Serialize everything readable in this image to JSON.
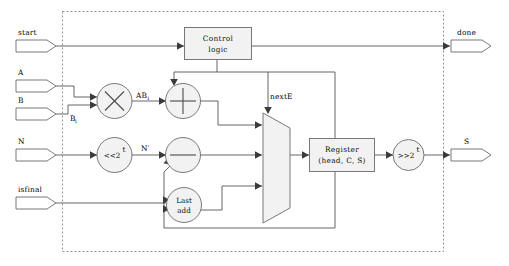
{
  "diagram": {
    "boundary": {
      "name": "module-boundary",
      "style": "dashed"
    },
    "colors": {
      "wire": "#555555",
      "block_fill": "#f2f2f2",
      "block_stroke": "#6a6a6a",
      "boundary": "#888888",
      "background": "#ffffff"
    },
    "input_ports": [
      {
        "id": "start",
        "label": "start"
      },
      {
        "id": "a",
        "label": "A"
      },
      {
        "id": "b",
        "label": "B"
      },
      {
        "id": "n",
        "label": "N"
      },
      {
        "id": "isfinal",
        "label": "isfinal"
      }
    ],
    "output_ports": [
      {
        "id": "done",
        "label": "done"
      },
      {
        "id": "s",
        "label": "S"
      }
    ],
    "blocks": [
      {
        "id": "control-logic",
        "line1": "Control",
        "line2": "logic",
        "shape": "rectangle"
      },
      {
        "id": "register",
        "line1": "Register",
        "line2": "(head, C, S)",
        "shape": "rectangle"
      },
      {
        "id": "last-add",
        "line1": "Last",
        "line2": "add",
        "shape": "circle"
      },
      {
        "id": "multiplier",
        "label": "×",
        "shape": "circle"
      },
      {
        "id": "adder",
        "label": "+",
        "shape": "circle"
      },
      {
        "id": "subtractor",
        "label": "−",
        "shape": "circle"
      },
      {
        "id": "shift-left",
        "label": "<<2",
        "exponent": "t",
        "shape": "circle"
      },
      {
        "id": "shift-right",
        "label": ">>2",
        "exponent": "t",
        "shape": "circle"
      },
      {
        "id": "mux",
        "label": "",
        "shape": "trapezoid"
      }
    ],
    "wire_labels": [
      {
        "id": "ab-i",
        "base": "AB",
        "sub": "i"
      },
      {
        "id": "b-i",
        "base": "B",
        "sub": "i"
      },
      {
        "id": "n-prime",
        "base": "N′",
        "sub": ""
      },
      {
        "id": "nexte",
        "base": "nextE",
        "sub": ""
      }
    ]
  }
}
